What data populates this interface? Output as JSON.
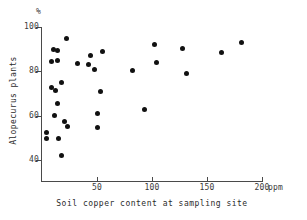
{
  "chart_data": {
    "type": "scatter",
    "title": "",
    "xlabel": "Soil copper content at sampling site",
    "ylabel": "Alopecurus plants",
    "x_unit": "ppm",
    "y_unit": "%",
    "xlim": [
      0,
      200
    ],
    "ylim": [
      33,
      100
    ],
    "xticks": [
      50,
      100,
      150,
      200
    ],
    "yticks": [
      40,
      60,
      80,
      100
    ],
    "xtick_labels": [
      "50",
      "100",
      "150",
      "200"
    ],
    "ytick_labels": [
      "40",
      "60",
      "80",
      "100"
    ],
    "grid": false,
    "legend": null,
    "marker": "filled-circle",
    "marker_color": "#111111",
    "axis_color": "#4a4a4a",
    "points": [
      {
        "x": 4,
        "y": 52.5
      },
      {
        "x": 4,
        "y": 49.5
      },
      {
        "x": 9,
        "y": 84.5
      },
      {
        "x": 9,
        "y": 72.5
      },
      {
        "x": 10,
        "y": 90.0
      },
      {
        "x": 11,
        "y": 60.0
      },
      {
        "x": 12,
        "y": 71.5
      },
      {
        "x": 14,
        "y": 89.5
      },
      {
        "x": 14,
        "y": 85.0
      },
      {
        "x": 14,
        "y": 65.5
      },
      {
        "x": 15,
        "y": 49.5
      },
      {
        "x": 18,
        "y": 75.0
      },
      {
        "x": 18,
        "y": 42.0
      },
      {
        "x": 20,
        "y": 57.5
      },
      {
        "x": 22,
        "y": 95.0
      },
      {
        "x": 23,
        "y": 55.0
      },
      {
        "x": 32,
        "y": 83.5
      },
      {
        "x": 42,
        "y": 83.0
      },
      {
        "x": 44,
        "y": 87.0
      },
      {
        "x": 48,
        "y": 81.0
      },
      {
        "x": 50,
        "y": 61.0
      },
      {
        "x": 50,
        "y": 54.5
      },
      {
        "x": 53,
        "y": 71.0
      },
      {
        "x": 55,
        "y": 89.0
      },
      {
        "x": 82,
        "y": 80.5
      },
      {
        "x": 93,
        "y": 63.0
      },
      {
        "x": 102,
        "y": 92.0
      },
      {
        "x": 104,
        "y": 84.0
      },
      {
        "x": 128,
        "y": 90.5
      },
      {
        "x": 131,
        "y": 79.0
      },
      {
        "x": 163,
        "y": 88.5
      },
      {
        "x": 181,
        "y": 93.0
      }
    ]
  }
}
